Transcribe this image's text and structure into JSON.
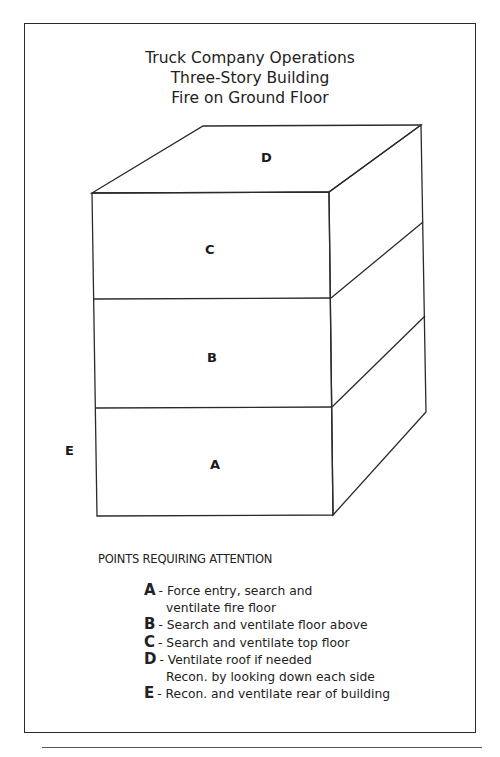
{
  "title": {
    "line1": "Truck Company Operations",
    "line2": "Three-Story Building",
    "line3": "Fire on Ground Floor"
  },
  "diagram": {
    "labels": {
      "roof": "D",
      "top_floor": "C",
      "second_floor": "B",
      "ground_floor": "A",
      "rear": "E"
    },
    "stroke_color": "#2a2a2a"
  },
  "legend": {
    "heading": "POINTS REQUIRING ATTENTION",
    "items": [
      {
        "key": "A",
        "text": "- Force entry, search and",
        "cont": "ventilate fire floor"
      },
      {
        "key": "B",
        "text": "- Search and ventilate floor above"
      },
      {
        "key": "C",
        "text": "- Search and ventilate top floor"
      },
      {
        "key": "D",
        "text": "- Ventilate roof if needed",
        "cont": "Recon. by looking down each side"
      },
      {
        "key": "E",
        "text": "- Recon. and ventilate rear of building"
      }
    ]
  }
}
